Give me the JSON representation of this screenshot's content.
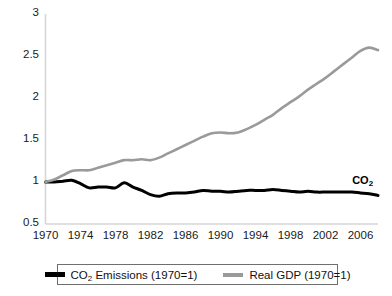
{
  "chart_data": {
    "type": "line",
    "title": "",
    "xlabel": "",
    "ylabel": "",
    "xlim": [
      1970,
      2008
    ],
    "ylim": [
      0.5,
      3
    ],
    "grid": false,
    "legend_position": "bottom",
    "xticks": [
      "1970",
      "1974",
      "1978",
      "1982",
      "1986",
      "1990",
      "1994",
      "1998",
      "2002",
      "2006"
    ],
    "xtick_values": [
      1970,
      1974,
      1978,
      1982,
      1986,
      1990,
      1994,
      1998,
      2002,
      2006
    ],
    "yticks": [
      "0.5",
      "1",
      "1.5",
      "2",
      "2.5",
      "3"
    ],
    "ytick_values": [
      0.5,
      1,
      1.5,
      2,
      2.5,
      3
    ],
    "x": [
      1970,
      1971,
      1972,
      1973,
      1974,
      1975,
      1976,
      1977,
      1978,
      1979,
      1980,
      1981,
      1982,
      1983,
      1984,
      1985,
      1986,
      1987,
      1988,
      1989,
      1990,
      1991,
      1992,
      1993,
      1994,
      1995,
      1996,
      1997,
      1998,
      1999,
      2000,
      2001,
      2002,
      2003,
      2004,
      2005,
      2006,
      2007,
      2008
    ],
    "series": [
      {
        "name": "CO2 Emissions (1970=1)",
        "color": "#000000",
        "values": [
          1.0,
          1.0,
          1.01,
          1.02,
          0.98,
          0.93,
          0.94,
          0.94,
          0.93,
          0.99,
          0.94,
          0.9,
          0.85,
          0.83,
          0.86,
          0.87,
          0.87,
          0.88,
          0.9,
          0.89,
          0.89,
          0.88,
          0.89,
          0.9,
          0.9,
          0.9,
          0.91,
          0.9,
          0.89,
          0.88,
          0.89,
          0.88,
          0.88,
          0.88,
          0.88,
          0.88,
          0.87,
          0.86,
          0.84
        ]
      },
      {
        "name": "Real GDP (1970=1)",
        "color": "#9a9a9a",
        "values": [
          1.0,
          1.03,
          1.08,
          1.13,
          1.14,
          1.14,
          1.17,
          1.2,
          1.23,
          1.26,
          1.26,
          1.27,
          1.26,
          1.29,
          1.34,
          1.39,
          1.44,
          1.49,
          1.54,
          1.58,
          1.59,
          1.58,
          1.59,
          1.63,
          1.68,
          1.74,
          1.8,
          1.88,
          1.95,
          2.02,
          2.1,
          2.17,
          2.24,
          2.32,
          2.4,
          2.48,
          2.56,
          2.6,
          2.57
        ]
      }
    ],
    "annotations": [
      {
        "text": "CO",
        "subscript": "2",
        "x": 2005.5,
        "y": 1.02,
        "bold": true
      }
    ]
  },
  "legend": {
    "items": [
      {
        "label_main": "CO",
        "label_sub": "2",
        "label_rest": " Emissions (1970=1)",
        "swatch": "co2"
      },
      {
        "label_main": "Real GDP (1970=1)",
        "label_sub": "",
        "label_rest": "",
        "swatch": "gdp"
      }
    ]
  },
  "axis": {
    "axis_color": "#d4d4d4",
    "tick_color": "#1a1a1a"
  }
}
